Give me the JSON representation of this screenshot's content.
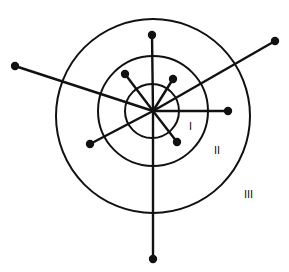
{
  "diagram": {
    "colors": {
      "stroke": "#111111",
      "background": "#ffffff"
    },
    "hub": {
      "x": 153,
      "y": 111
    },
    "circles": [
      {
        "name": "zone-I",
        "cx": 152,
        "cy": 111,
        "r": 27
      },
      {
        "name": "zone-II",
        "cx": 153,
        "cy": 111,
        "r": 55
      },
      {
        "name": "zone-III",
        "cx": 153,
        "cy": 116,
        "r": 97
      }
    ],
    "spokes": [
      {
        "name": "top",
        "x": 152,
        "y": 35
      },
      {
        "name": "bottom",
        "x": 153,
        "y": 259
      },
      {
        "name": "far-left",
        "x": 15,
        "y": 66
      },
      {
        "name": "far-upper-right",
        "x": 275,
        "y": 41
      },
      {
        "name": "lower-left",
        "x": 90,
        "y": 144
      },
      {
        "name": "right",
        "x": 228,
        "y": 111
      },
      {
        "name": "upper-left-short",
        "x": 125,
        "y": 74
      },
      {
        "name": "upper-right-short",
        "x": 173,
        "y": 79
      },
      {
        "name": "lower-right-short",
        "x": 177,
        "y": 142
      }
    ],
    "labels": [
      {
        "text": "I",
        "x": 189,
        "y": 130
      },
      {
        "text": "II",
        "x": 214,
        "y": 154
      },
      {
        "text": "III",
        "x": 244,
        "y": 198
      }
    ]
  }
}
